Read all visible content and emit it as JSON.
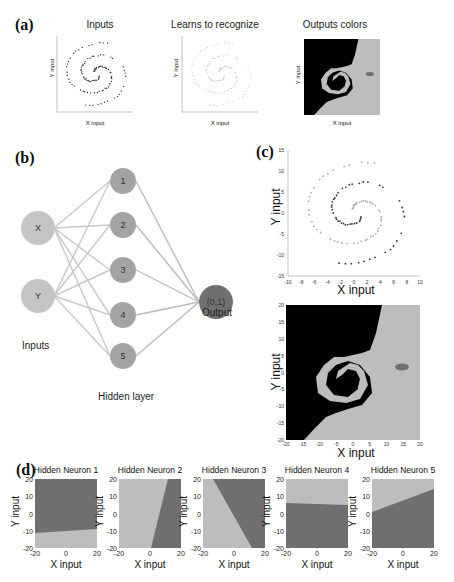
{
  "panels": {
    "a": {
      "label": "(a)",
      "subplots": [
        {
          "title": "Inputs",
          "xlabel": "X input",
          "ylabel": "Y input",
          "kind": "scatter"
        },
        {
          "title": "Learns to recognize",
          "xlabel": "X input",
          "ylabel": "Y input",
          "kind": "scatter-faint"
        },
        {
          "title": "Outputs colors",
          "xlabel": "X input",
          "ylabel": "Y input",
          "kind": "region"
        }
      ]
    },
    "b": {
      "label": "(b)",
      "inputs": [
        "X",
        "Y"
      ],
      "hidden": [
        "1",
        "2",
        "3",
        "4",
        "5"
      ],
      "output": "(0,1)",
      "inputs_label": "Inputs",
      "hidden_label": "Hidden layer",
      "output_label": "Output"
    },
    "c": {
      "label": "(c)",
      "scatter": {
        "xlabel": "X input",
        "ylabel": "Y input",
        "xticks": [
          "-10",
          "-8",
          "-6",
          "-4",
          "-2",
          "0",
          "2",
          "4",
          "6",
          "8",
          "10"
        ],
        "yticks": [
          "15",
          "10",
          "5",
          "0",
          "-5",
          "-10",
          "-15"
        ]
      },
      "region": {
        "xlabel": "X input",
        "ylabel": "Y input",
        "xticks": [
          "-20",
          "-15",
          "-10",
          "-5",
          "0",
          "5",
          "10",
          "15",
          "20"
        ],
        "yticks": [
          "20",
          "15",
          "10",
          "5",
          "0",
          "-5",
          "-10",
          "-15",
          "-20"
        ]
      }
    },
    "d": {
      "label": "(d)",
      "neurons": [
        {
          "title": "Hidden Neuron 1",
          "xlabel": "X input",
          "ylabel": "Y input"
        },
        {
          "title": "Hidden Neuron 2",
          "xlabel": "X input",
          "ylabel": "Y input"
        },
        {
          "title": "Hidden Neuron 3",
          "xlabel": "X input",
          "ylabel": "Y input"
        },
        {
          "title": "Hidden Neuron 4",
          "xlabel": "X input",
          "ylabel": "Y input"
        },
        {
          "title": "Hidden Neuron 5",
          "xlabel": "X input",
          "ylabel": "Y input"
        }
      ],
      "ticks": {
        "x": [
          "-20",
          "0",
          "20"
        ],
        "y": [
          "20",
          "10",
          "0",
          "-10",
          "-20"
        ]
      }
    }
  },
  "colors": {
    "dark_region": "#6f6f6f",
    "light_region": "#bdbdbd",
    "input_node": "#c4c4c4",
    "hidden_node": "#a3a3a3",
    "output_node": "#707070",
    "edge": "#c8c8c8"
  }
}
